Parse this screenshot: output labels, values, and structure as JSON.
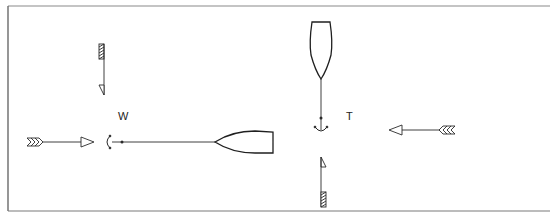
{
  "diagram": {
    "colors": {
      "line": "#2a2a2a",
      "frame": "#7a7a7a",
      "background": "#ffffff"
    },
    "left_panel": {
      "label": "W",
      "boat_orientation": "bow pointing right, riding to anchor on the left",
      "arrows": [
        {
          "name": "horizontal-arrow",
          "direction": "right",
          "fletching": "feathered"
        },
        {
          "name": "vertical-arrow",
          "direction": "down",
          "fletching": "hatched"
        }
      ]
    },
    "right_panel": {
      "label": "T",
      "boat_orientation": "bow pointing up, riding to anchor below",
      "arrows": [
        {
          "name": "horizontal-arrow",
          "direction": "left",
          "fletching": "feathered"
        },
        {
          "name": "vertical-arrow",
          "direction": "up",
          "fletching": "hatched"
        }
      ]
    }
  }
}
